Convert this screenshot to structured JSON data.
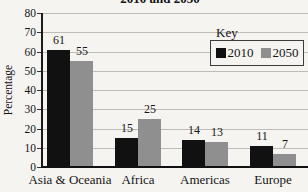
{
  "legend": {
    "title": "Key",
    "items": [
      {
        "label": "2010",
        "color": "#111111"
      },
      {
        "label": "2050",
        "color": "#8f8f8f"
      }
    ]
  },
  "chart_data": {
    "type": "bar",
    "title": "2010 and 2050",
    "title_note": "title partially cropped at top edge of image",
    "xlabel": "",
    "ylabel": "Percentage",
    "ylim": [
      0,
      80
    ],
    "ytick_step": 10,
    "grid": true,
    "legend_position": "top-right",
    "categories": [
      "Asia & Oceania",
      "Africa",
      "Americas",
      "Europe"
    ],
    "series": [
      {
        "name": "2010",
        "color": "#111111",
        "values": [
          61,
          15,
          14,
          11
        ]
      },
      {
        "name": "2050",
        "color": "#8f8f8f",
        "values": [
          55,
          25,
          13,
          7
        ]
      }
    ]
  }
}
